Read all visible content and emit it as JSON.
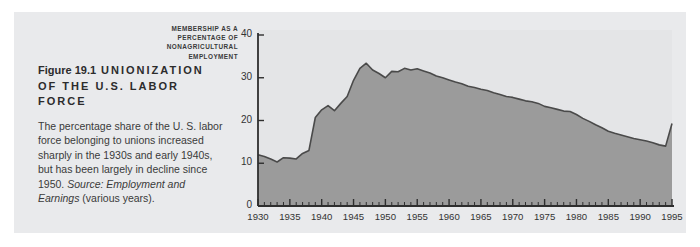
{
  "figure": {
    "number": "Figure 19.1",
    "title": "UNIONIZATION OF THE U.S. LABOR FORCE",
    "body": "The percentage share of the U. S. labor force belonging to unions increased sharply in the 1930s and early 1940s, but has been largely in decline since 1950. ",
    "source": "Source: Employment and Earnings",
    "source_detail": " (various years)."
  },
  "colors": {
    "panel_background": "#e9eaec",
    "plot_background": "#e4e5e7",
    "area_fill": "#9b9b9b",
    "area_stroke": "#4a4a4a",
    "axis": "#2e2e2e",
    "text": "#333333"
  },
  "chart_data": {
    "type": "area",
    "title": "Unionization of the U.S. Labor Force",
    "series_label": "Labor union\nmembership",
    "xlabel": "",
    "ylabel": "MEMBERSHIP AS A PERCENTAGE OF NONAGRICULTURAL EMPLOYMENT",
    "ylabel_lines": [
      "MEMBERSHIP AS A",
      "PERCENTAGE OF",
      "NONAGRICULTURAL",
      "EMPLOYMENT"
    ],
    "grid": false,
    "legend_position": "inline-annotation",
    "xlim": [
      1930,
      1995
    ],
    "ylim": [
      0,
      40
    ],
    "ytick_labels": [
      "0",
      "10",
      "20",
      "30",
      "40"
    ],
    "yticks": [
      0,
      10,
      20,
      30,
      40
    ],
    "xtick_labels": [
      "1930",
      "1935",
      "1940",
      "1945",
      "1950",
      "1955",
      "1960",
      "1965",
      "1970",
      "1975",
      "1980",
      "1985",
      "1990",
      "1995"
    ],
    "xticks": [
      1930,
      1935,
      1940,
      1945,
      1950,
      1955,
      1960,
      1965,
      1970,
      1975,
      1980,
      1985,
      1990,
      1995
    ],
    "x_minor_tick_interval": 1,
    "x": [
      1930,
      1931,
      1932,
      1933,
      1934,
      1935,
      1936,
      1937,
      1938,
      1939,
      1940,
      1941,
      1942,
      1943,
      1944,
      1945,
      1946,
      1947,
      1948,
      1949,
      1950,
      1951,
      1952,
      1953,
      1954,
      1955,
      1956,
      1957,
      1958,
      1959,
      1960,
      1961,
      1962,
      1963,
      1964,
      1965,
      1966,
      1967,
      1968,
      1969,
      1970,
      1971,
      1972,
      1973,
      1974,
      1975,
      1976,
      1977,
      1978,
      1979,
      1980,
      1981,
      1982,
      1983,
      1984,
      1985,
      1986,
      1987,
      1988,
      1989,
      1990,
      1991,
      1992,
      1993,
      1994,
      1995
    ],
    "values": [
      12.0,
      11.6,
      11.0,
      10.3,
      11.3,
      11.2,
      11.0,
      12.3,
      13.0,
      20.7,
      22.5,
      23.5,
      22.3,
      24.0,
      25.6,
      29.4,
      32.2,
      33.4,
      31.8,
      31.0,
      30.0,
      31.5,
      31.4,
      32.2,
      31.8,
      32.1,
      31.6,
      31.1,
      30.4,
      30.0,
      29.5,
      29.0,
      28.6,
      28.0,
      27.7,
      27.3,
      27.0,
      26.5,
      26.1,
      25.6,
      25.4,
      25.0,
      24.6,
      24.4,
      24.0,
      23.3,
      23.0,
      22.6,
      22.2,
      22.1,
      21.4,
      20.5,
      19.8,
      19.0,
      18.3,
      17.5,
      17.0,
      16.6,
      16.2,
      15.8,
      15.5,
      15.2,
      14.8,
      14.3,
      14.0,
      19.3
    ]
  }
}
